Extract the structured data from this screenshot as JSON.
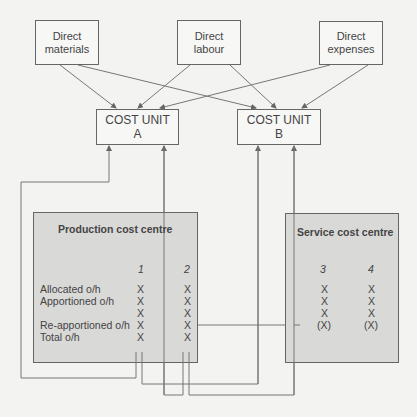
{
  "sources": [
    {
      "line1": "Direct",
      "line2": "materials"
    },
    {
      "line1": "Direct",
      "line2": "labour"
    },
    {
      "line1": "Direct",
      "line2": "expenses"
    }
  ],
  "cost_units": [
    {
      "line1": "COST UNIT",
      "line2": "A"
    },
    {
      "line1": "COST UNIT",
      "line2": "B"
    }
  ],
  "production": {
    "title": "Production cost centre",
    "columns": [
      "1",
      "2"
    ],
    "row_labels": [
      "Allocated o/h",
      "Apportioned o/h",
      "",
      "Re-apportioned o/h",
      "Total o/h"
    ],
    "col1": [
      "X",
      "X",
      "X",
      "X",
      "X"
    ],
    "col2": [
      "X",
      "X",
      "X",
      "X",
      "X"
    ]
  },
  "service": {
    "title": "Service cost centre",
    "columns": [
      "3",
      "4"
    ],
    "col3": [
      "X",
      "X",
      "X",
      "(X)"
    ],
    "col4": [
      "X",
      "X",
      "X",
      "(X)"
    ]
  },
  "colors": {
    "line": "#777777",
    "centre_fill": "#d9d9d8",
    "box_border": "#666666"
  }
}
